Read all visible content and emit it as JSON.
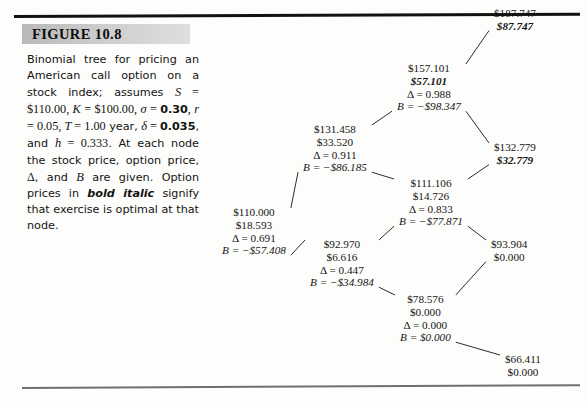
{
  "figure": {
    "label": "FIGURE 10.8",
    "caption_runs": [
      {
        "t": "Binomial tree for pricing an American call option on a stock index; assumes ",
        "style": "plain"
      },
      {
        "t": "S",
        "style": "mathit"
      },
      {
        "t": " = ",
        "style": "mathnum"
      },
      {
        "t": "$110.00",
        "style": "mathnum"
      },
      {
        "t": ", ",
        "style": "mathnum"
      },
      {
        "t": "K",
        "style": "mathit"
      },
      {
        "t": " = ",
        "style": "mathnum"
      },
      {
        "t": "$100.00",
        "style": "mathnum"
      },
      {
        "t": ", ",
        "style": "mathnum"
      },
      {
        "t": "σ",
        "style": "mathit"
      },
      {
        "t": " = ",
        "style": "mathnum"
      },
      {
        "t": "0.30",
        "style": "bnum"
      },
      {
        "t": ", ",
        "style": "mathnum"
      },
      {
        "t": "r",
        "style": "mathit"
      },
      {
        "t": " = ",
        "style": "mathnum"
      },
      {
        "t": "0.05",
        "style": "mathnum"
      },
      {
        "t": ", ",
        "style": "mathnum"
      },
      {
        "t": "T",
        "style": "mathit"
      },
      {
        "t": " = ",
        "style": "mathnum"
      },
      {
        "t": "1.00",
        "style": "mathnum"
      },
      {
        "t": " year, ",
        "style": "plain"
      },
      {
        "t": "δ",
        "style": "mathit"
      },
      {
        "t": " = ",
        "style": "mathnum"
      },
      {
        "t": "0.035",
        "style": "bnum"
      },
      {
        "t": ", and ",
        "style": "plain"
      },
      {
        "t": "h",
        "style": "mathit"
      },
      {
        "t": " = ",
        "style": "mathnum"
      },
      {
        "t": "0.333",
        "style": "mathnum"
      },
      {
        "t": ". At each node the stock price, option price, ",
        "style": "plain"
      },
      {
        "t": "Δ",
        "style": "mathnum"
      },
      {
        "t": ", and ",
        "style": "plain"
      },
      {
        "t": "B",
        "style": "mathit"
      },
      {
        "t": " are given. Option prices in ",
        "style": "plain"
      },
      {
        "t": "bold italic",
        "style": "bolditalic"
      },
      {
        "t": " signify that exercise is optimal at that node.",
        "style": "plain"
      }
    ],
    "caption_plain": "Binomial tree for pricing an American call option on a stock index; assumes S = $110.00, K = $100.00, σ = 0.30, r = 0.05, T = 1.00 year, δ = 0.035, and h = 0.333. At each node the stock price, option price, Δ, and B are given. Option prices in bold italic signify that exercise is optimal at that node."
  },
  "chart_data": {
    "type": "diagram",
    "title": "Binomial tree for pricing an American call option on a stock index",
    "subtype": "binomial-tree",
    "parameters": {
      "S": "$110.00",
      "K": "$100.00",
      "sigma": "0.30",
      "r": "0.05",
      "T": "1.00 year",
      "delta": "0.035",
      "h": "0.333",
      "steps": 3
    },
    "legend_note": "Option prices in bold italic signify that exercise is optimal at that node.",
    "nodes": [
      {
        "id": "n0",
        "step": 0,
        "ups": 0,
        "stock": "$110.000",
        "option": "$18.593",
        "delta": "Δ = 0.691",
        "bond": "B = −$57.408",
        "exercise_optimal": false,
        "x": 222,
        "y": 206
      },
      {
        "id": "n1u",
        "step": 1,
        "ups": 1,
        "stock": "$131.458",
        "option": "$33.520",
        "delta": "Δ = 0.911",
        "bond": "B = −$86.185",
        "exercise_optimal": false,
        "x": 303,
        "y": 123
      },
      {
        "id": "n1d",
        "step": 1,
        "ups": 0,
        "stock": "$92.970",
        "option": "$6.616",
        "delta": "Δ = 0.447",
        "bond": "B = −$34.984",
        "exercise_optimal": false,
        "x": 310,
        "y": 238
      },
      {
        "id": "n2uu",
        "step": 2,
        "ups": 2,
        "stock": "$157.101",
        "option": "$57.101",
        "delta": "Δ = 0.988",
        "bond": "B = −$98.347",
        "exercise_optimal": true,
        "x": 397,
        "y": 62
      },
      {
        "id": "n2ud",
        "step": 2,
        "ups": 1,
        "stock": "$111.106",
        "option": "$14.726",
        "delta": "Δ = 0.833",
        "bond": "B = −$77.871",
        "exercise_optimal": false,
        "x": 399,
        "y": 177
      },
      {
        "id": "n2dd",
        "step": 2,
        "ups": 0,
        "stock": "$78.576",
        "option": "$0.000",
        "delta": "Δ = 0.000",
        "bond": "B = $0.000",
        "exercise_optimal": false,
        "x": 400,
        "y": 293
      },
      {
        "id": "n3uuu",
        "step": 3,
        "ups": 3,
        "stock": "$187.747",
        "option": "$87.747",
        "delta": "",
        "bond": "",
        "exercise_optimal": true,
        "x": 494,
        "y": 7
      },
      {
        "id": "n3uud",
        "step": 3,
        "ups": 2,
        "stock": "$132.779",
        "option": "$32.779",
        "delta": "",
        "bond": "",
        "exercise_optimal": true,
        "x": 494,
        "y": 141
      },
      {
        "id": "n3udd",
        "step": 3,
        "ups": 1,
        "stock": "$93.904",
        "option": "$0.000",
        "delta": "",
        "bond": "",
        "exercise_optimal": false,
        "x": 491,
        "y": 238
      },
      {
        "id": "n3ddd",
        "step": 3,
        "ups": 0,
        "stock": "$66.411",
        "option": "$0.000",
        "delta": "",
        "bond": "",
        "exercise_optimal": false,
        "x": 505,
        "y": 353
      }
    ],
    "edges": [
      {
        "from": "n0",
        "to": "n1u"
      },
      {
        "from": "n0",
        "to": "n1d"
      },
      {
        "from": "n1u",
        "to": "n2uu"
      },
      {
        "from": "n1u",
        "to": "n2ud"
      },
      {
        "from": "n1d",
        "to": "n2ud"
      },
      {
        "from": "n1d",
        "to": "n2dd"
      },
      {
        "from": "n2uu",
        "to": "n3uuu"
      },
      {
        "from": "n2uu",
        "to": "n3uud"
      },
      {
        "from": "n2ud",
        "to": "n3uud"
      },
      {
        "from": "n2ud",
        "to": "n3udd"
      },
      {
        "from": "n2dd",
        "to": "n3udd"
      },
      {
        "from": "n2dd",
        "to": "n3ddd"
      }
    ]
  },
  "colors": {
    "ink": "#151515",
    "rule_top": "#121212",
    "rule_bottom": "#6f6f6f",
    "head_band_left": "#b9b9b9",
    "head_band_right": "#dedede",
    "page": "#fdfdfb"
  }
}
